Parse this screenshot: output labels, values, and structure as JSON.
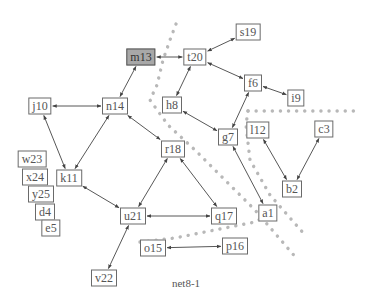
{
  "caption": "net8-1",
  "colors": {
    "edge": "#444444",
    "node_border": "#6a6a6a",
    "node_highlight": "#a8a8a8",
    "cut_dots": "#b8b8b8"
  },
  "nodes": [
    {
      "id": "m13",
      "label": "m13",
      "x": 141,
      "y": 57,
      "highlight": true
    },
    {
      "id": "t20",
      "label": "t20",
      "x": 195,
      "y": 57
    },
    {
      "id": "s19",
      "label": "s19",
      "x": 248,
      "y": 32
    },
    {
      "id": "f6",
      "label": "f6",
      "x": 253,
      "y": 83
    },
    {
      "id": "i9",
      "label": "i9",
      "x": 296,
      "y": 98
    },
    {
      "id": "h8",
      "label": "h8",
      "x": 172,
      "y": 105
    },
    {
      "id": "g7",
      "label": "g7",
      "x": 228,
      "y": 137
    },
    {
      "id": "l12",
      "label": "l12",
      "x": 258,
      "y": 130
    },
    {
      "id": "c3",
      "label": "c3",
      "x": 324,
      "y": 129
    },
    {
      "id": "b2",
      "label": "b2",
      "x": 292,
      "y": 189
    },
    {
      "id": "a1",
      "label": "a1",
      "x": 268,
      "y": 213
    },
    {
      "id": "q17",
      "label": "q17",
      "x": 224,
      "y": 216
    },
    {
      "id": "p16",
      "label": "p16",
      "x": 235,
      "y": 246
    },
    {
      "id": "o15",
      "label": "o15",
      "x": 153,
      "y": 248
    },
    {
      "id": "u21",
      "label": "u21",
      "x": 133,
      "y": 216
    },
    {
      "id": "r18",
      "label": "r18",
      "x": 173,
      "y": 149
    },
    {
      "id": "n14",
      "label": "n14",
      "x": 115,
      "y": 106
    },
    {
      "id": "j10",
      "label": "j10",
      "x": 40,
      "y": 106
    },
    {
      "id": "k11",
      "label": "k11",
      "x": 69,
      "y": 178
    },
    {
      "id": "v22",
      "label": "v22",
      "x": 104,
      "y": 278
    },
    {
      "id": "w23",
      "label": "w23",
      "x": 32,
      "y": 159
    },
    {
      "id": "x24",
      "label": "x24",
      "x": 35,
      "y": 177
    },
    {
      "id": "y25",
      "label": "y25",
      "x": 41,
      "y": 194
    },
    {
      "id": "d4",
      "label": "d4",
      "x": 45,
      "y": 212
    },
    {
      "id": "e5",
      "label": "e5",
      "x": 51,
      "y": 228
    }
  ],
  "edges": [
    {
      "from": "m13",
      "to": "t20",
      "arrows": "both"
    },
    {
      "from": "t20",
      "to": "s19",
      "arrows": "both"
    },
    {
      "from": "t20",
      "to": "f6",
      "arrows": "both"
    },
    {
      "from": "f6",
      "to": "i9",
      "arrows": "both"
    },
    {
      "from": "t20",
      "to": "h8",
      "arrows": "both"
    },
    {
      "from": "h8",
      "to": "g7",
      "arrows": "both"
    },
    {
      "from": "f6",
      "to": "g7",
      "arrows": "both"
    },
    {
      "from": "g7",
      "to": "a1",
      "arrows": "both"
    },
    {
      "from": "l12",
      "to": "b2",
      "arrows": "both"
    },
    {
      "from": "c3",
      "to": "b2",
      "arrows": "both"
    },
    {
      "from": "m13",
      "to": "n14",
      "arrows": "both"
    },
    {
      "from": "j10",
      "to": "n14",
      "arrows": "both"
    },
    {
      "from": "n14",
      "to": "r18",
      "arrows": "both"
    },
    {
      "from": "j10",
      "to": "k11",
      "arrows": "both"
    },
    {
      "from": "n14",
      "to": "k11",
      "arrows": "both"
    },
    {
      "from": "k11",
      "to": "u21",
      "arrows": "both"
    },
    {
      "from": "r18",
      "to": "u21",
      "arrows": "both"
    },
    {
      "from": "r18",
      "to": "q17",
      "arrows": "both"
    },
    {
      "from": "u21",
      "to": "q17",
      "arrows": "both"
    },
    {
      "from": "o15",
      "to": "p16",
      "arrows": "both"
    },
    {
      "from": "u21",
      "to": "v22",
      "arrows": "both"
    }
  ],
  "cut_lines": [
    {
      "points": [
        [
          176,
          24
        ],
        [
          170,
          40
        ],
        [
          163,
          60
        ],
        [
          157,
          85
        ],
        [
          150,
          100
        ],
        [
          168,
          125
        ],
        [
          195,
          150
        ],
        [
          225,
          180
        ],
        [
          255,
          210
        ],
        [
          298,
          260
        ]
      ]
    },
    {
      "points": [
        [
          248,
          111
        ],
        [
          355,
          111
        ]
      ]
    },
    {
      "points": [
        [
          248,
          111
        ],
        [
          246,
          125
        ],
        [
          250,
          160
        ],
        [
          270,
          195
        ],
        [
          305,
          235
        ]
      ]
    },
    {
      "points": [
        [
          140,
          242
        ],
        [
          175,
          238
        ],
        [
          215,
          230
        ],
        [
          255,
          222
        ],
        [
          280,
          208
        ]
      ]
    }
  ]
}
